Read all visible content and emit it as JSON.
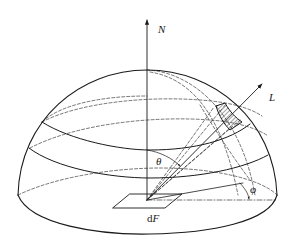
{
  "figure": {
    "type": "hemisphere-radiance-geometry",
    "labels": {
      "normal": "N",
      "direction": "L",
      "polar_angle": "θ",
      "azimuth_angle": "φ",
      "surface_element": "dF"
    },
    "colors": {
      "stroke": "#1a1a1a",
      "background": "#ffffff"
    }
  }
}
